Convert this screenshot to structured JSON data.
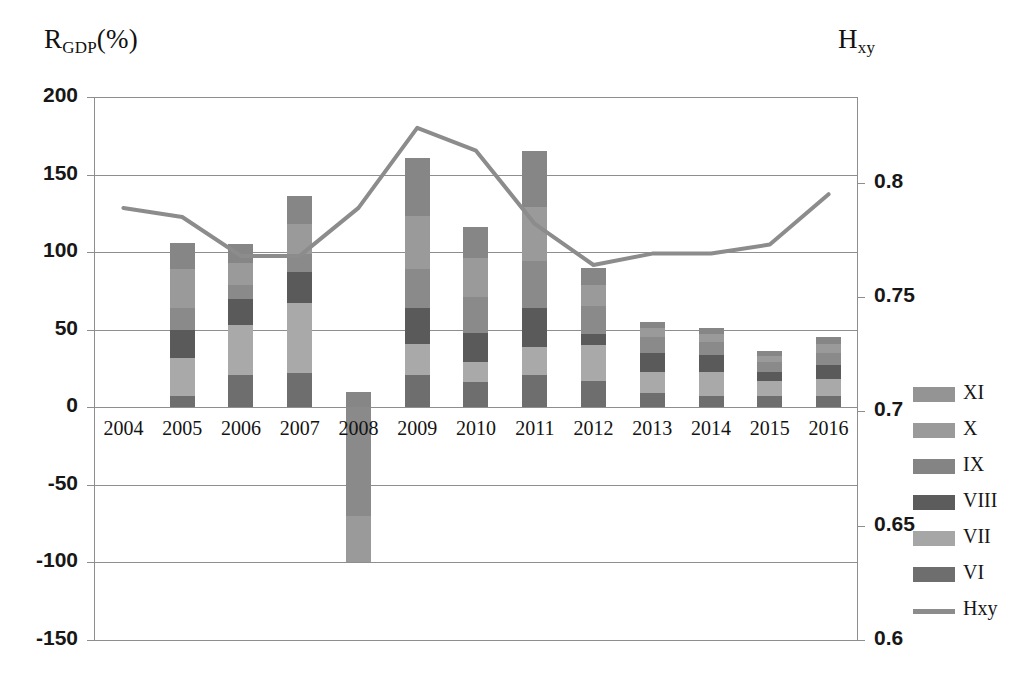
{
  "chart_data": {
    "type": "bar",
    "subtype": "stacked-bar-with-line",
    "title": "",
    "xlabel": "",
    "ylabel": "R_GDP(%)",
    "y2label": "H_xy",
    "grid": true,
    "legend_position": "right",
    "categories": [
      "2004",
      "2005",
      "2006",
      "2007",
      "2008",
      "2009",
      "2010",
      "2011",
      "2012",
      "2013",
      "2014",
      "2015",
      "2016"
    ],
    "ylim": [
      -150,
      200
    ],
    "yticks": [
      "200",
      "150",
      "100",
      "50",
      "0",
      "-50",
      "-100",
      "-150"
    ],
    "ytick_values": [
      200,
      150,
      100,
      50,
      0,
      -50,
      -100,
      -150
    ],
    "y2lim": [
      0.6,
      0.8375
    ],
    "y2ticks": [
      "0.8",
      "0.75",
      "0.7",
      "0.65",
      "0.6"
    ],
    "y2tick_values": [
      0.8,
      0.75,
      0.7,
      0.65,
      0.6
    ],
    "series": [
      {
        "name": "VI",
        "color": "#6e6e6e",
        "values": [
          0,
          7,
          21,
          22,
          0,
          21,
          16,
          21,
          17,
          9,
          7,
          7,
          7
        ]
      },
      {
        "name": "VII",
        "color": "#a9a9a9",
        "values": [
          0,
          25,
          32,
          45,
          0,
          20,
          13,
          18,
          23,
          14,
          16,
          10,
          11
        ]
      },
      {
        "name": "VIII",
        "color": "#5a5a5a",
        "values": [
          0,
          18,
          17,
          20,
          0,
          23,
          19,
          25,
          7,
          12,
          11,
          6,
          9
        ]
      },
      {
        "name": "IX",
        "color": "#8a8a8a",
        "values": [
          0,
          14,
          9,
          12,
          -70,
          25,
          23,
          30,
          18,
          10,
          8,
          6,
          8
        ]
      },
      {
        "name": "X",
        "color": "#9a9a9a",
        "values": [
          0,
          25,
          14,
          19,
          -30,
          34,
          25,
          35,
          14,
          6,
          5,
          4,
          6
        ]
      },
      {
        "name": "XI",
        "color": "#868686",
        "values": [
          0,
          17,
          12,
          18,
          10,
          38,
          20,
          36,
          11,
          4,
          4,
          3,
          4
        ]
      }
    ],
    "bar_totals": [
      0,
      106,
      105,
      136,
      -100,
      161,
      116,
      165,
      90,
      55,
      51,
      36,
      45
    ],
    "line": {
      "name": "Hxy",
      "color": "#8c8c8c",
      "values": [
        0.789,
        0.785,
        0.768,
        0.768,
        0.789,
        0.824,
        0.814,
        0.782,
        0.764,
        0.769,
        0.769,
        0.773,
        0.795
      ]
    }
  },
  "legend": {
    "items": [
      {
        "label": "XI",
        "color": "#949494",
        "type": "swatch"
      },
      {
        "label": "X",
        "color": "#9a9a9a",
        "type": "swatch"
      },
      {
        "label": "IX",
        "color": "#848484",
        "type": "swatch"
      },
      {
        "label": "VIII",
        "color": "#5c5c5c",
        "type": "swatch"
      },
      {
        "label": "VII",
        "color": "#a6a6a6",
        "type": "swatch"
      },
      {
        "label": "VI",
        "color": "#6e6e6e",
        "type": "swatch"
      },
      {
        "label": "Hxy",
        "color": "#8c8c8c",
        "type": "line"
      }
    ]
  },
  "axes": {
    "left_title_main": "R",
    "left_title_sub": "GDP",
    "left_title_suffix": "(%)",
    "right_title_main": "H",
    "right_title_sub": "xy"
  },
  "colors": {
    "grid": "#8e8e8e",
    "text": "#171717",
    "background": "#ffffff"
  }
}
